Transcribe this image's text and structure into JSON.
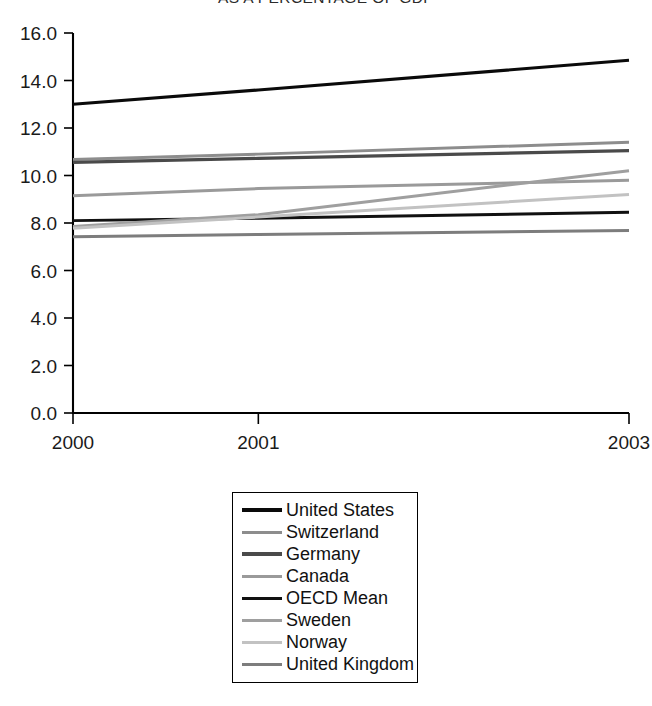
{
  "chart_data": {
    "type": "line",
    "title": "AS A PERCENTAGE OF GDP",
    "xlabel": "",
    "ylabel": "",
    "x": [
      "2000",
      "2001",
      "2003"
    ],
    "x_positions": [
      2000,
      2001,
      2003
    ],
    "categories": [
      "2000",
      "2001",
      "2003"
    ],
    "xlim": [
      2000,
      2003
    ],
    "ylim": [
      0.0,
      16.0
    ],
    "ytick_labels": [
      "0.0",
      "2.0",
      "4.0",
      "6.0",
      "8.0",
      "10.0",
      "12.0",
      "14.0",
      "16.0"
    ],
    "ytick_values": [
      0.0,
      2.0,
      4.0,
      6.0,
      8.0,
      10.0,
      12.0,
      14.0,
      16.0
    ],
    "xtick_labels": [
      "2000",
      "2001",
      "2003"
    ],
    "grid": false,
    "legend_position": "below-center",
    "series": [
      {
        "name": "United States",
        "color": "#0a0a0a",
        "width": 3.1,
        "values": [
          13.0,
          13.6,
          14.85
        ]
      },
      {
        "name": "Switzerland",
        "color": "#8d8d8d",
        "width": 3.0,
        "values": [
          10.67,
          10.9,
          11.4
        ]
      },
      {
        "name": "Germany",
        "color": "#4a4a4a",
        "width": 3.2,
        "values": [
          10.55,
          10.72,
          11.05
        ]
      },
      {
        "name": "Canada",
        "color": "#9a9a9a",
        "width": 3.0,
        "values": [
          9.15,
          9.45,
          9.8
        ]
      },
      {
        "name": "OECD Mean",
        "color": "#111111",
        "width": 2.9,
        "values": [
          8.1,
          8.2,
          8.45
        ]
      },
      {
        "name": "Sweden",
        "color": "#9f9f9f",
        "width": 3.0,
        "values": [
          7.85,
          8.35,
          10.2
        ]
      },
      {
        "name": "Norway",
        "color": "#c2c2c2",
        "width": 3.0,
        "values": [
          7.78,
          8.25,
          9.2
        ]
      },
      {
        "name": "United Kingdom",
        "color": "#7d7d7d",
        "width": 3.0,
        "values": [
          7.42,
          7.52,
          7.68
        ]
      }
    ]
  },
  "legend": {
    "items": [
      {
        "label": "United States"
      },
      {
        "label": "Switzerland"
      },
      {
        "label": "Germany"
      },
      {
        "label": "Canada"
      },
      {
        "label": "OECD Mean"
      },
      {
        "label": "Sweden"
      },
      {
        "label": "Norway"
      },
      {
        "label": "United Kingdom"
      }
    ]
  }
}
